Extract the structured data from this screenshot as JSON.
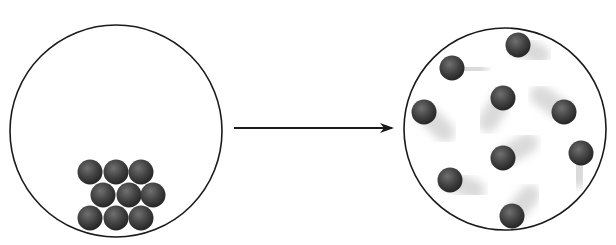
{
  "diagram": {
    "title": "",
    "colors": {
      "outline": "#1a1a1a",
      "particle": "#3a3a3a",
      "particle_highlight": "#6a6a6a",
      "trail": "#d0d0d0",
      "background": "#ffffff"
    },
    "left_container": {
      "label": "packed-state",
      "cx": 116,
      "cy": 131,
      "r": 106,
      "particles": [
        {
          "x": 90,
          "y": 172
        },
        {
          "x": 116,
          "y": 172
        },
        {
          "x": 141,
          "y": 172
        },
        {
          "x": 103,
          "y": 195
        },
        {
          "x": 129,
          "y": 195
        },
        {
          "x": 153,
          "y": 195
        },
        {
          "x": 90,
          "y": 218
        },
        {
          "x": 116,
          "y": 218
        },
        {
          "x": 141,
          "y": 218
        }
      ]
    },
    "arrow": {
      "x1": 234,
      "y1": 128,
      "x2": 392,
      "y2": 128
    },
    "right_container": {
      "label": "dispersed-state",
      "cx": 505,
      "cy": 129,
      "r": 101,
      "particles": [
        {
          "x": 518,
          "y": 45,
          "tx": 540,
          "ty": 55
        },
        {
          "x": 452,
          "y": 68,
          "tx": 478,
          "ty": 70
        },
        {
          "x": 424,
          "y": 112,
          "tx": 445,
          "ty": 132
        },
        {
          "x": 503,
          "y": 98,
          "tx": 488,
          "ty": 122
        },
        {
          "x": 564,
          "y": 112,
          "tx": 540,
          "ty": 95
        },
        {
          "x": 503,
          "y": 158,
          "tx": 528,
          "ty": 143
        },
        {
          "x": 581,
          "y": 153,
          "tx": 578,
          "ty": 178
        },
        {
          "x": 450,
          "y": 180,
          "tx": 475,
          "ty": 190
        },
        {
          "x": 512,
          "y": 216,
          "tx": 530,
          "ty": 195
        }
      ]
    }
  }
}
